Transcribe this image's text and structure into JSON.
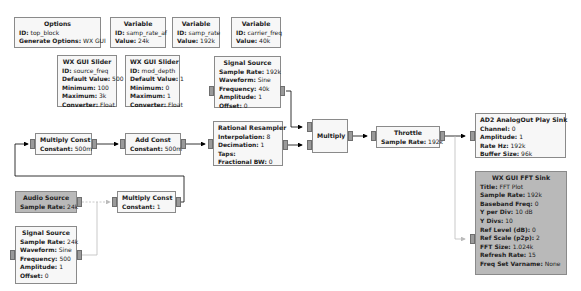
{
  "blocks": {
    "options": {
      "title": "Options",
      "rows": [
        [
          "ID:",
          "top_block"
        ],
        [
          "Generate Options:",
          "WX GUI"
        ]
      ]
    },
    "var_af": {
      "title": "Variable",
      "rows": [
        [
          "ID:",
          "samp_rate_af"
        ],
        [
          "Value:",
          "24k"
        ]
      ]
    },
    "var_rate": {
      "title": "Variable",
      "rows": [
        [
          "ID:",
          "samp_rate"
        ],
        [
          "Value:",
          "192k"
        ]
      ]
    },
    "var_carrier": {
      "title": "Variable",
      "rows": [
        [
          "ID:",
          "carrier_freq"
        ],
        [
          "Value:",
          "40k"
        ]
      ]
    },
    "slider_src": {
      "title": "WX GUI Slider",
      "rows": [
        [
          "ID:",
          "source_freq"
        ],
        [
          "Default Value:",
          "500"
        ],
        [
          "Minimum:",
          "100"
        ],
        [
          "Maximum:",
          "3k"
        ],
        [
          "Converter:",
          "Float"
        ]
      ]
    },
    "slider_mod": {
      "title": "WX GUI Slider",
      "rows": [
        [
          "ID:",
          "mod_depth"
        ],
        [
          "Default Value:",
          "1"
        ],
        [
          "Minimum:",
          "0"
        ],
        [
          "Maximum:",
          "1"
        ],
        [
          "Converter:",
          "Float"
        ]
      ]
    },
    "sig_carrier": {
      "title": "Signal Source",
      "rows": [
        [
          "Sample Rate:",
          "192k"
        ],
        [
          "Waveform:",
          "Sine"
        ],
        [
          "Frequency:",
          "40k"
        ],
        [
          "Amplitude:",
          "1"
        ],
        [
          "Offset:",
          "0"
        ]
      ]
    },
    "mult_const1": {
      "title": "Multiply Const",
      "rows": [
        [
          "Constant:",
          "500m"
        ]
      ]
    },
    "add_const": {
      "title": "Add Const",
      "rows": [
        [
          "Constant:",
          "500m"
        ]
      ]
    },
    "resampler": {
      "title": "Rational Resampler",
      "rows": [
        [
          "Interpolation:",
          "8"
        ],
        [
          "Decimation:",
          "1"
        ],
        [
          "Taps:",
          ""
        ],
        [
          "Fractional BW:",
          "0"
        ]
      ]
    },
    "multiply": {
      "title": "Multiply",
      "rows": []
    },
    "throttle": {
      "title": "Throttle",
      "rows": [
        [
          "Sample Rate:",
          "192k"
        ]
      ]
    },
    "ad2_sink": {
      "title": "AD2 AnalogOut Play Sink",
      "rows": [
        [
          "Channel:",
          "0"
        ],
        [
          "Amplitude:",
          "1"
        ],
        [
          "Rate Hz:",
          "192k"
        ],
        [
          "Buffer Size:",
          "96k"
        ]
      ]
    },
    "audio_src": {
      "title": "Audio Source",
      "rows": [
        [
          "Sample Rate:",
          "24k"
        ]
      ]
    },
    "mult_const2": {
      "title": "Multiply Const",
      "rows": [
        [
          "Constant:",
          "1"
        ]
      ]
    },
    "sig_audio": {
      "title": "Signal Source",
      "rows": [
        [
          "Sample Rate:",
          "24k"
        ],
        [
          "Waveform:",
          "Sine"
        ],
        [
          "Frequency:",
          "500"
        ],
        [
          "Amplitude:",
          "1"
        ],
        [
          "Offset:",
          "0"
        ]
      ]
    },
    "fft_sink": {
      "title": "WX GUI FFT Sink",
      "rows": [
        [
          "Title:",
          "FFT Plot"
        ],
        [
          "Sample Rate:",
          "192k"
        ],
        [
          "Baseband Freq:",
          "0"
        ],
        [
          "Y per Div:",
          "10 dB"
        ],
        [
          "Y Divs:",
          "10"
        ],
        [
          "Ref Level (dB):",
          "0"
        ],
        [
          "Ref Scale (p2p):",
          "2"
        ],
        [
          "FFT Size:",
          "1.024k"
        ],
        [
          "Refresh Rate:",
          "15"
        ],
        [
          "Freq Set Varname:",
          "None"
        ]
      ]
    }
  }
}
